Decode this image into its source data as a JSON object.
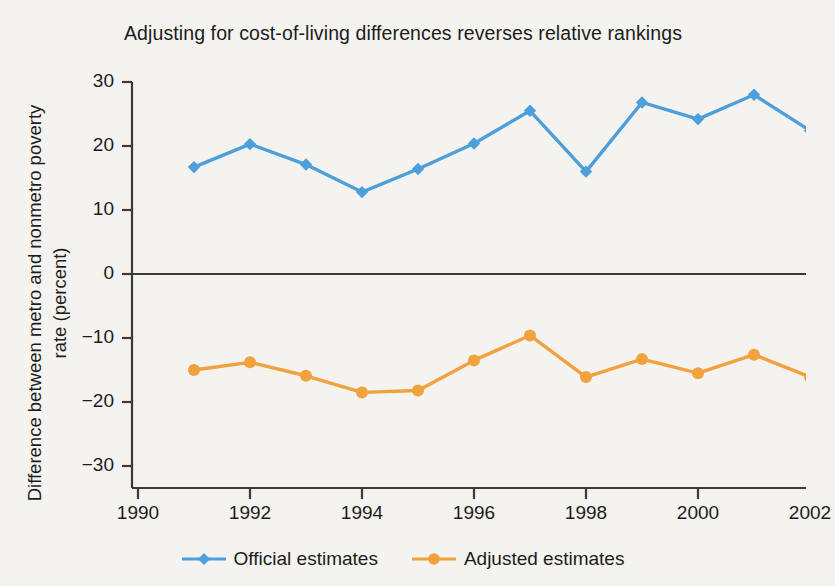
{
  "chart_data": {
    "type": "line",
    "title": "Adjusting for cost-of-living differences reverses relative rankings",
    "xlabel": "",
    "ylabel": "Difference between metro and nonmetro poverty rate (percent)",
    "x": [
      1991,
      1992,
      1993,
      1994,
      1995,
      1996,
      1997,
      1998,
      1999,
      2000,
      2001,
      2002
    ],
    "xlim": [
      1990,
      2002.3
    ],
    "ylim": [
      -33,
      32
    ],
    "xticks": [
      1990,
      1992,
      1994,
      1996,
      1998,
      2000,
      2002
    ],
    "xtick_labels": [
      "1990",
      "1992",
      "1994",
      "1996",
      "1998",
      "2000",
      "2002"
    ],
    "yticks": [
      30,
      20,
      10,
      0,
      -10,
      -20,
      -30
    ],
    "ytick_labels": [
      "30",
      "20",
      "10",
      "0",
      "−10",
      "−20",
      "−30"
    ],
    "grid": false,
    "legend_position": "bottom",
    "zero_line": 0,
    "series": [
      {
        "name": "Official estimates",
        "color": "#4d9fdb",
        "marker": "diamond",
        "values": [
          16.7,
          20.3,
          17.1,
          12.8,
          16.4,
          20.4,
          25.5,
          16.0,
          26.8,
          24.2,
          28.0,
          22.4
        ]
      },
      {
        "name": "Adjusted estimates",
        "color": "#f2a13f",
        "marker": "circle",
        "values": [
          -15.0,
          -13.8,
          -15.9,
          -18.5,
          -18.2,
          -13.5,
          -9.6,
          -16.1,
          -13.3,
          -15.5,
          -12.6,
          -16.1
        ]
      }
    ]
  },
  "legend": {
    "items": [
      {
        "label": "Official estimates",
        "color": "#4d9fdb",
        "marker": "diamond-marker"
      },
      {
        "label": "Adjusted estimates",
        "color": "#f2a13f",
        "marker": "circle-marker"
      }
    ]
  },
  "colors": {
    "background": "#f4f3ef",
    "axis": "#3a3a3a",
    "text": "#1c1c1c",
    "official": "#4d9fdb",
    "adjusted": "#f2a13f"
  }
}
